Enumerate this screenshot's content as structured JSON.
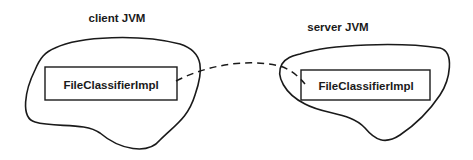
{
  "diagram": {
    "client": {
      "title": "client JVM",
      "object_label": "FileClassifierImpl"
    },
    "server": {
      "title": "server JVM",
      "object_label": "FileClassifierImpl"
    },
    "connection": {
      "style": "dashed",
      "from": "client.FileClassifierImpl",
      "to": "server.FileClassifierImpl"
    },
    "colors": {
      "stroke": "#1a1a1a",
      "background": "#ffffff"
    }
  }
}
